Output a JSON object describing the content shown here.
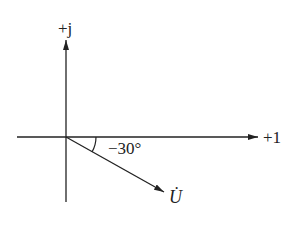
{
  "diagram": {
    "type": "phasor",
    "axes": {
      "real_label": "+1",
      "imag_label": "+j"
    },
    "phasor": {
      "name": "U",
      "label": "U̇",
      "angle_deg": -30
    },
    "angle_label": "−30°",
    "colors": {
      "line": "#222222",
      "background": "#ffffff"
    }
  }
}
